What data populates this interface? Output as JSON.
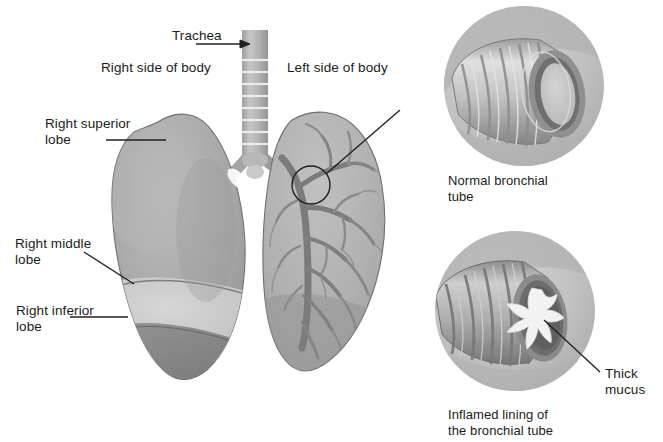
{
  "figure": {
    "kind": "medical-illustration",
    "background_color": "#ffffff",
    "text_color": "#1b1b1b"
  },
  "labels": {
    "trachea": "Trachea",
    "right_side_of_body": "Right side of body",
    "left_side_of_body": "Left side of body",
    "right_superior_lobe": "Right superior\nlobe",
    "right_middle_lobe": "Right middle\nlobe",
    "right_inferior_lobe": "Right inferior\nlobe",
    "normal_bronchial_tube": "Normal bronchial\ntube",
    "thick_mucus": "Thick\nmucus",
    "inflamed_lining": "Inflamed lining of\nthe bronchial tube"
  },
  "palette": {
    "lung_body": "#a9a9a9",
    "lung_body_dark": "#8d8d8d",
    "lung_superior_lobe": "#a2a2a2",
    "lung_middle_lobe": "#c9c9c9",
    "lung_inferior_lobe": "#7f7f7f",
    "left_lung_fill": "#b0b0b0",
    "bronchial_tree": "#7d7d7d",
    "trachea_fill": "#b5b5b5",
    "trachea_ring": "#f2f2f2",
    "inset_disc": "#c4c4c4",
    "inset_disc_shadow": "#a6a6a6",
    "tube_light": "#d8d8d8",
    "tube_mid": "#b4b4b4",
    "tube_dark": "#8a8a8a",
    "lumen_dark": "#6f6f6f",
    "lumen_inner": "#c6c6c6",
    "inflamed_wall": "#707070",
    "mucus": "#f4f4f4",
    "leader_line": "#1f1f1f"
  }
}
